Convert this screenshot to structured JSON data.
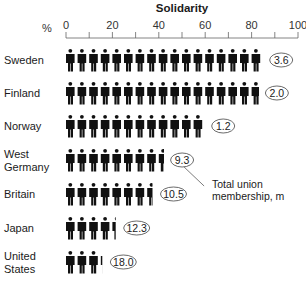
{
  "chart_data": {
    "type": "bar",
    "style": "pictogram",
    "title": "Solidarity",
    "xlabel": "%",
    "ylabel": "",
    "xlim": [
      0,
      100
    ],
    "x_ticks": [
      0,
      20,
      40,
      60,
      80,
      100
    ],
    "x_minor_ticks": [
      10,
      30,
      50,
      70,
      90
    ],
    "unit_per_figure": 5,
    "categories": [
      [
        "Sweden"
      ],
      [
        "Finland"
      ],
      [
        "Norway"
      ],
      [
        "West",
        "Germany"
      ],
      [
        "Britain"
      ],
      [
        "Japan"
      ],
      [
        "United",
        "States"
      ]
    ],
    "category_names": [
      "Sweden",
      "Finland",
      "Norway",
      "West Germany",
      "Britain",
      "Japan",
      "United States"
    ],
    "series": [
      {
        "name": "Union density (%)",
        "values": [
          85,
          84,
          60,
          43,
          38,
          22,
          16
        ]
      },
      {
        "name": "Total union membership, m",
        "values": [
          3.6,
          2.0,
          1.2,
          9.3,
          10.5,
          12.3,
          18.0
        ]
      }
    ],
    "membership_labels": [
      "3.6",
      "2.0",
      "1.2",
      "9.3",
      "10.5",
      "12.3",
      "18.0"
    ],
    "annotation": {
      "text_lines": [
        "Total union",
        "membership, m"
      ],
      "points_to": "West Germany"
    },
    "grid": false,
    "legend": "none"
  }
}
